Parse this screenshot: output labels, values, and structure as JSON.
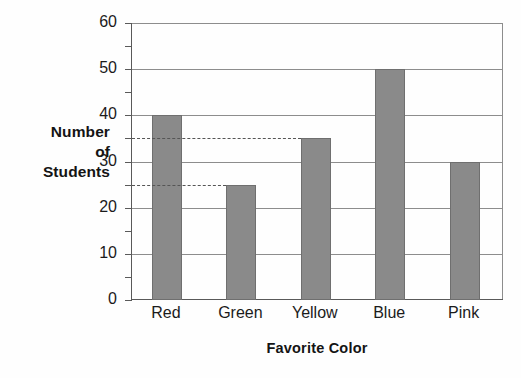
{
  "chart_data": {
    "type": "bar",
    "title": "",
    "xlabel": "Favorite Color",
    "ylabel": "Number of Students",
    "ylabel_lines": [
      "Number",
      "of",
      "Students"
    ],
    "categories": [
      "Red",
      "Green",
      "Yellow",
      "Blue",
      "Pink"
    ],
    "values": [
      40,
      25,
      35,
      50,
      30
    ],
    "ylim": [
      0,
      60
    ],
    "y_major_ticks": [
      0,
      10,
      20,
      30,
      40,
      50,
      60
    ],
    "y_minor_ticks": [
      5,
      15,
      25,
      35,
      45,
      55
    ],
    "y_tick_labels": [
      "0",
      "10",
      "20",
      "30",
      "40",
      "50",
      "60"
    ],
    "grid": "horizontal-major",
    "legend": "none",
    "bar_color": "#8a8a8a",
    "bar_edge_color": "#6f6f6f",
    "grid_color": "#8d8d8d",
    "axis_color": "#595959",
    "annotations": [
      {
        "type": "dashed-line",
        "value": 35,
        "extends_to_category": "Yellow"
      },
      {
        "type": "dashed-line",
        "value": 25,
        "extends_to_category": "Green"
      }
    ]
  }
}
